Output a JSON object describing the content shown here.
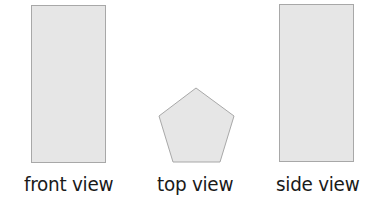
{
  "diagram": {
    "fill_color": "#e6e6e6",
    "stroke_color": "#a8a8a8",
    "text_color": "#1a1a1a",
    "views": [
      {
        "id": "front",
        "shape": "rectangle",
        "label": "front view"
      },
      {
        "id": "top",
        "shape": "pentagon",
        "label": "top view",
        "points": "196,88 234,116 220,162 173,162 159,116"
      },
      {
        "id": "side",
        "shape": "rectangle",
        "label": "side view"
      }
    ]
  }
}
